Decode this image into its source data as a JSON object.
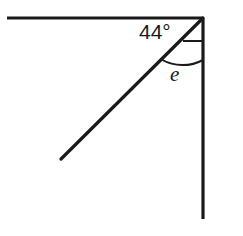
{
  "figure": {
    "type": "geometry-angle-diagram",
    "width": 243,
    "height": 236,
    "background_color": "#ffffff",
    "stroke_color": "#1a1a1a",
    "labels": {
      "given_angle": "44°",
      "unknown_angle": "e"
    },
    "geometry": {
      "vertex": {
        "x": 203,
        "y": 18
      },
      "horizontal_ray": {
        "x1": 7,
        "y1": 18,
        "x2": 203,
        "y2": 18,
        "width": 3.2
      },
      "vertical_ray": {
        "x1": 203,
        "y1": 18,
        "x2": 203,
        "y2": 219,
        "width": 3.2
      },
      "diagonal_ray": {
        "x1": 203,
        "y1": 18,
        "x2": 61,
        "y2": 159,
        "width": 3.2
      },
      "angle_tick_segment": {
        "x1": 183,
        "y1": 41,
        "x2": 203,
        "y2": 41,
        "width": 2
      },
      "angle_arc": {
        "start_x": 160,
        "start_y": 61,
        "end_x": 203,
        "end_y": 60,
        "radius": 43,
        "width": 2
      },
      "label_positions": {
        "given_angle": {
          "x": 139,
          "y": 21
        },
        "unknown_angle": {
          "x": 170,
          "y": 64
        }
      }
    }
  }
}
